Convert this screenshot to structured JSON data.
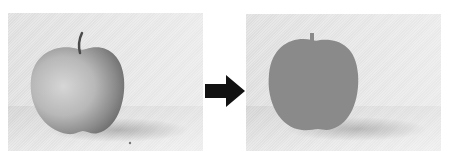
{
  "figure": {
    "left_panel": {
      "label": "original-apple-photo"
    },
    "arrow": {
      "icon": "arrow-right-icon",
      "color": "#111111"
    },
    "right_panel": {
      "label": "segmented-apple-silhouette",
      "fill_color": "#8a8a8a"
    },
    "colors": {
      "background": "#ffffff",
      "panel_bg": "#e2e2e2",
      "apple_light": "#cfcfcf",
      "apple_dark": "#6e6e6e",
      "silhouette": "#8a8a8a"
    }
  }
}
